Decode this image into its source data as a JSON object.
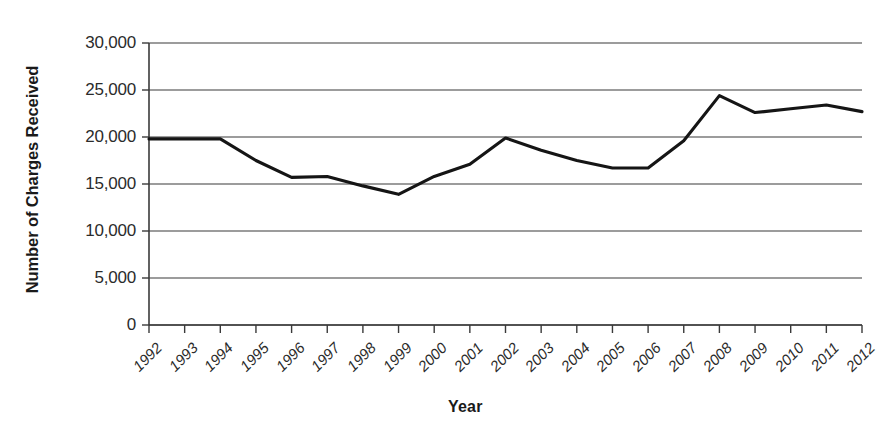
{
  "chart_data": {
    "type": "line",
    "title": "",
    "xlabel": "Year",
    "ylabel": "Number of Charges Received",
    "categories": [
      "1992",
      "1993",
      "1994",
      "1995",
      "1996",
      "1997",
      "1998",
      "1999",
      "2000",
      "2001",
      "2002",
      "2003",
      "2004",
      "2005",
      "2006",
      "2007",
      "2008",
      "2009",
      "2010",
      "2011",
      "2012"
    ],
    "values": [
      19800,
      19800,
      19800,
      17500,
      15700,
      15800,
      14800,
      13900,
      15800,
      17100,
      19900,
      18600,
      17500,
      16700,
      16700,
      19600,
      24400,
      22600,
      23000,
      23400,
      22700
    ],
    "series": [
      {
        "name": "Number of Charges Received",
        "values": [
          19800,
          19800,
          19800,
          17500,
          15700,
          15800,
          14800,
          13900,
          15800,
          17100,
          19900,
          18600,
          17500,
          16700,
          16700,
          19600,
          24400,
          22600,
          23000,
          23400,
          22700
        ]
      }
    ],
    "ylim": [
      0,
      30000
    ],
    "yticks": [
      0,
      5000,
      10000,
      15000,
      20000,
      25000,
      30000
    ],
    "ytick_labels": [
      "0",
      "5,000",
      "10,000",
      "15,000",
      "20,000",
      "25,000",
      "30,000"
    ],
    "grid": "horizontal",
    "legend": "none",
    "line_color": "#151515",
    "grid_color": "#3a3a3a",
    "axis_color": "#3a3a3a",
    "xtick_rotation": -45
  }
}
